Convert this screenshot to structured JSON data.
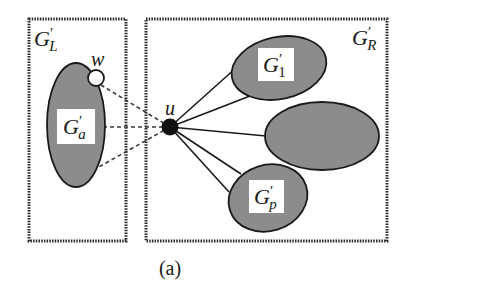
{
  "figure": {
    "caption": "(a)",
    "colors": {
      "background": "#ffffff",
      "ellipse_fill": "#8c8c8c",
      "outline": "#1a1a1a",
      "box_border": "#2a2a2a",
      "label_bg": "#ffffff"
    }
  },
  "left_box": {
    "title": {
      "main": "G",
      "prime": "′",
      "sub": "L"
    }
  },
  "right_box": {
    "title": {
      "main": "G",
      "prime": "′",
      "sub": "R"
    }
  },
  "nodes": {
    "u": {
      "label": "u",
      "style": "filled-black"
    },
    "w": {
      "label": "w",
      "style": "hollow-white"
    }
  },
  "components": {
    "ga": {
      "main": "G",
      "prime": "′",
      "sub": "a"
    },
    "g1": {
      "main": "G",
      "prime": "′",
      "sub": "1"
    },
    "middle": {
      "label": ""
    },
    "gp": {
      "main": "G",
      "prime": "′",
      "sub": "p"
    }
  },
  "edges": {
    "dashed": [
      "u-w",
      "u-Ga(mid)",
      "u-Ga(lower)"
    ],
    "solid": [
      "u-G1(upper)",
      "u-G1(lower)",
      "u-middle",
      "u-Gp(upper)",
      "u-Gp(lower)"
    ]
  }
}
